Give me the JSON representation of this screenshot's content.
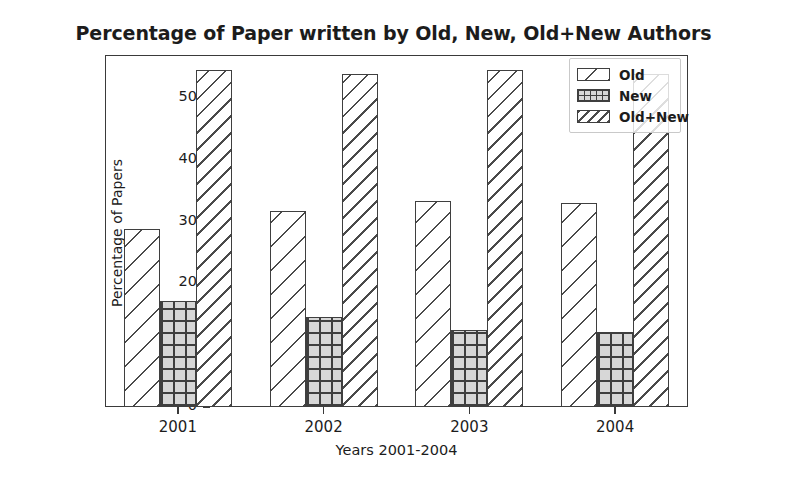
{
  "chart_data": {
    "type": "bar",
    "title": "Percentage of Paper written by Old, New, Old+New Authors",
    "xlabel": "Years 2001-2004",
    "ylabel": "Percentage of Papers",
    "categories": [
      "2001",
      "2002",
      "2003",
      "2004"
    ],
    "series": [
      {
        "name": "Old",
        "values": [
          28.8,
          31.8,
          33.3,
          33.0
        ],
        "hatch": "diagonal-sparse"
      },
      {
        "name": "New",
        "values": [
          17.1,
          14.5,
          12.4,
          12.2
        ],
        "hatch": "crosshatch-grid"
      },
      {
        "name": "Old+New",
        "values": [
          54.5,
          54.0,
          54.6,
          54.0
        ],
        "hatch": "diagonal-dense"
      }
    ],
    "ylim": [
      0,
      57
    ],
    "yticks": [
      "0",
      "10",
      "20",
      "30",
      "40",
      "50"
    ],
    "ytick_values": [
      0,
      10,
      20,
      30,
      40,
      50
    ],
    "xtick_labels": [
      "2001",
      "2002",
      "2003",
      "2004"
    ],
    "grid": false,
    "legend_position": "upper right",
    "colors": {
      "bar_face": "#ffffff",
      "bar_edge": "#3f3f3f",
      "new_face": "#d7d7d7",
      "axis": "#3a3a3a",
      "text": "#1c1c1c",
      "background": "#ffffff"
    }
  },
  "legend": {
    "entries": [
      {
        "label": "Old"
      },
      {
        "label": "New"
      },
      {
        "label": "Old+New"
      }
    ]
  }
}
